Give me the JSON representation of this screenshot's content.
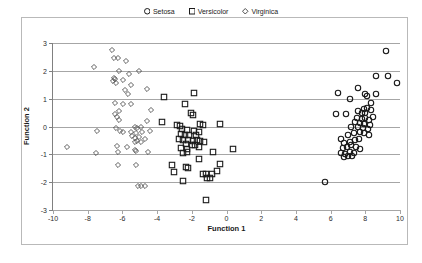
{
  "chart_data": {
    "type": "scatter",
    "title": "",
    "xlabel": "Function 1",
    "ylabel": "Function 2",
    "xlim": [
      -10,
      10
    ],
    "ylim": [
      -3,
      3
    ],
    "xticks": [
      -10,
      -8,
      -6,
      -4,
      -2,
      0,
      2,
      4,
      6,
      8,
      10
    ],
    "yticks": [
      3,
      2,
      1,
      0,
      -1,
      -2,
      -3
    ],
    "grid": "horizontal",
    "legend_position": "top-center",
    "series": [
      {
        "name": "Setosa",
        "marker": "circle",
        "color": "#1a1a1a",
        "points": [
          [
            9.2,
            2.7
          ],
          [
            8.6,
            1.8
          ],
          [
            9.3,
            1.8
          ],
          [
            9.8,
            1.55
          ],
          [
            6.4,
            1.2
          ],
          [
            7.6,
            1.4
          ],
          [
            8.0,
            1.15
          ],
          [
            8.6,
            1.18
          ],
          [
            7.1,
            1.0
          ],
          [
            8.1,
            1.1
          ],
          [
            8.3,
            0.85
          ],
          [
            6.3,
            0.45
          ],
          [
            6.9,
            0.45
          ],
          [
            7.9,
            0.62
          ],
          [
            8.1,
            0.65
          ],
          [
            8.3,
            0.6
          ],
          [
            7.6,
            0.55
          ],
          [
            7.8,
            0.48
          ],
          [
            8.0,
            0.5
          ],
          [
            8.45,
            0.35
          ],
          [
            7.5,
            0.3
          ],
          [
            7.8,
            0.28
          ],
          [
            8.0,
            0.32
          ],
          [
            8.2,
            0.22
          ],
          [
            7.4,
            0.15
          ],
          [
            7.7,
            0.12
          ],
          [
            7.95,
            0.1
          ],
          [
            8.25,
            0.05
          ],
          [
            7.2,
            0.0
          ],
          [
            7.6,
            -0.02
          ],
          [
            7.85,
            -0.05
          ],
          [
            8.15,
            -0.08
          ],
          [
            6.6,
            -0.45
          ],
          [
            7.0,
            -0.3
          ],
          [
            7.35,
            -0.25
          ],
          [
            7.7,
            -0.2
          ],
          [
            7.95,
            -0.22
          ],
          [
            8.2,
            -0.3
          ],
          [
            6.8,
            -0.6
          ],
          [
            7.1,
            -0.55
          ],
          [
            7.4,
            -0.5
          ],
          [
            7.65,
            -0.45
          ],
          [
            6.7,
            -0.78
          ],
          [
            6.95,
            -0.72
          ],
          [
            7.2,
            -0.68
          ],
          [
            7.45,
            -0.75
          ],
          [
            7.7,
            -0.82
          ],
          [
            6.6,
            -0.95
          ],
          [
            6.85,
            -1.0
          ],
          [
            7.1,
            -0.9
          ],
          [
            7.35,
            -0.95
          ],
          [
            6.75,
            -1.08
          ],
          [
            7.0,
            -1.05
          ],
          [
            7.25,
            -1.05
          ],
          [
            5.7,
            -2.0
          ]
        ]
      },
      {
        "name": "Versicolor",
        "marker": "square",
        "color": "#1a1a1a",
        "points": [
          [
            -1.9,
            1.2
          ],
          [
            -3.6,
            1.05
          ],
          [
            -2.4,
            0.8
          ],
          [
            -2.05,
            0.5
          ],
          [
            -1.95,
            0.42
          ],
          [
            -3.7,
            0.15
          ],
          [
            -2.85,
            0.05
          ],
          [
            -2.7,
            0.02
          ],
          [
            -1.5,
            0.1
          ],
          [
            -1.35,
            0.05
          ],
          [
            -0.4,
            0.08
          ],
          [
            -2.55,
            -0.1
          ],
          [
            -2.3,
            -0.12
          ],
          [
            -1.85,
            -0.15
          ],
          [
            -1.6,
            -0.2
          ],
          [
            -2.65,
            -0.28
          ],
          [
            -2.4,
            -0.3
          ],
          [
            -2.15,
            -0.32
          ],
          [
            -1.75,
            -0.3
          ],
          [
            -2.75,
            -0.45
          ],
          [
            -2.5,
            -0.48
          ],
          [
            -2.2,
            -0.5
          ],
          [
            -1.95,
            -0.52
          ],
          [
            -1.7,
            -0.5
          ],
          [
            -1.5,
            -0.52
          ],
          [
            -1.3,
            -0.55
          ],
          [
            -2.35,
            -0.62
          ],
          [
            -2.0,
            -0.65
          ],
          [
            -1.8,
            -0.68
          ],
          [
            -2.6,
            -0.78
          ],
          [
            -2.3,
            -0.8
          ],
          [
            -1.6,
            -0.75
          ],
          [
            0.4,
            -0.82
          ],
          [
            -0.75,
            -0.9
          ],
          [
            -2.5,
            -0.95
          ],
          [
            -2.25,
            -0.92
          ],
          [
            -1.6,
            -1.15
          ],
          [
            -0.35,
            -1.35
          ],
          [
            -3.15,
            -1.4
          ],
          [
            -2.35,
            -1.45
          ],
          [
            -2.2,
            -1.5
          ],
          [
            -3.0,
            -1.65
          ],
          [
            -1.35,
            -1.7
          ],
          [
            -1.2,
            -1.72
          ],
          [
            -0.85,
            -1.72
          ],
          [
            -0.55,
            -1.6
          ],
          [
            -1.15,
            -1.85
          ],
          [
            -0.95,
            -1.85
          ],
          [
            -2.5,
            -1.95
          ],
          [
            -1.2,
            -2.65
          ]
        ]
      },
      {
        "name": "Virginica",
        "marker": "diamond",
        "color": "#4d4d4d",
        "points": [
          [
            -6.6,
            2.75
          ],
          [
            -6.5,
            2.45
          ],
          [
            -6.25,
            2.45
          ],
          [
            -5.8,
            2.35
          ],
          [
            -7.65,
            2.15
          ],
          [
            -6.2,
            2.0
          ],
          [
            -5.05,
            1.98
          ],
          [
            -5.6,
            1.9
          ],
          [
            -6.5,
            1.75
          ],
          [
            -6.4,
            1.7
          ],
          [
            -6.55,
            1.62
          ],
          [
            -6.35,
            1.55
          ],
          [
            -5.95,
            1.68
          ],
          [
            -5.5,
            1.5
          ],
          [
            -5.85,
            1.3
          ],
          [
            -4.6,
            1.35
          ],
          [
            -5.65,
            1.15
          ],
          [
            -6.4,
            0.85
          ],
          [
            -5.95,
            0.82
          ],
          [
            -5.5,
            0.82
          ],
          [
            -6.2,
            0.55
          ],
          [
            -6.45,
            0.45
          ],
          [
            -6.3,
            0.35
          ],
          [
            -4.35,
            0.58
          ],
          [
            -6.2,
            0.25
          ],
          [
            -4.6,
            0.2
          ],
          [
            -6.35,
            -0.05
          ],
          [
            -5.3,
            0.0
          ],
          [
            -5.15,
            -0.05
          ],
          [
            -4.95,
            0.0
          ],
          [
            -7.45,
            -0.15
          ],
          [
            -6.15,
            -0.15
          ],
          [
            -5.95,
            -0.2
          ],
          [
            -5.5,
            -0.18
          ],
          [
            -5.2,
            -0.22
          ],
          [
            -4.85,
            -0.2
          ],
          [
            -4.4,
            -0.15
          ],
          [
            -5.45,
            -0.35
          ],
          [
            -5.25,
            -0.4
          ],
          [
            -5.05,
            -0.38
          ],
          [
            -4.7,
            -0.45
          ],
          [
            -5.3,
            -0.55
          ],
          [
            -5.15,
            -0.52
          ],
          [
            -4.9,
            -0.55
          ],
          [
            -9.2,
            -0.72
          ],
          [
            -6.3,
            -0.7
          ],
          [
            -5.75,
            -0.72
          ],
          [
            -7.55,
            -0.95
          ],
          [
            -6.25,
            -0.92
          ],
          [
            -5.3,
            -0.85
          ],
          [
            -5.2,
            -0.88
          ],
          [
            -4.55,
            -0.92
          ],
          [
            -6.25,
            -1.38
          ],
          [
            -5.2,
            -1.4
          ],
          [
            -5.1,
            -2.15
          ],
          [
            -4.95,
            -2.15
          ],
          [
            -4.7,
            -2.15
          ]
        ]
      }
    ]
  },
  "legend": {
    "items": [
      {
        "label": "Setosa",
        "marker": "circle"
      },
      {
        "label": "Versicolor",
        "marker": "square"
      },
      {
        "label": "Virginica",
        "marker": "diamond"
      }
    ]
  }
}
